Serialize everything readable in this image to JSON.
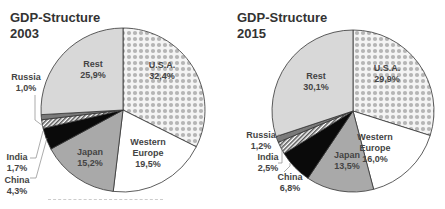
{
  "chart_data": [
    {
      "type": "pie",
      "title": "GDP-Structure 2003",
      "title_lines": [
        "GDP-Structure",
        "2003"
      ],
      "categories": [
        "U.S.A.",
        "Western Europe",
        "Japan",
        "China",
        "India",
        "Russia",
        "Rest"
      ],
      "values": [
        32.4,
        19.5,
        15.2,
        4.3,
        1.7,
        1.0,
        25.9
      ],
      "labels": [
        "32,4%",
        "19,5%",
        "15,2%",
        "4,3%",
        "1,7%",
        "1,0%",
        "25,9%"
      ],
      "unit": "%"
    },
    {
      "type": "pie",
      "title": "GDP-Structure 2015",
      "title_lines": [
        "GDP-Structure",
        "2015"
      ],
      "categories": [
        "U.S.A.",
        "Western Europe",
        "Japan",
        "China",
        "India",
        "Russia",
        "Rest"
      ],
      "values": [
        29.9,
        16.0,
        13.5,
        6.8,
        2.5,
        1.2,
        30.1
      ],
      "labels": [
        "29,9%",
        "16,0%",
        "13,5%",
        "6,8%",
        "2,5%",
        "1,2%",
        "30,1%"
      ],
      "unit": "%"
    }
  ],
  "legend_colors": {
    "U.S.A.": "pattern-diamond",
    "Western Europe": "#ffffff",
    "Japan": "#a9a9a9",
    "China": "#0a0a0a",
    "India": "pattern-hatch",
    "Russia": "#7a7a7a",
    "Rest": "#d8d8d8"
  }
}
